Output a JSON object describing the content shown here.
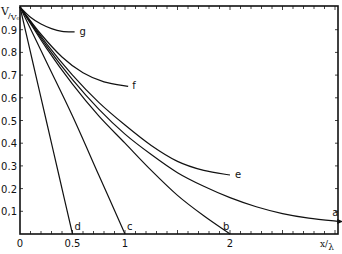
{
  "chart_data": {
    "type": "line",
    "title": "",
    "xlabel": "x/λ",
    "ylabel": "V/V₀",
    "xlim": [
      0,
      3.1
    ],
    "ylim": [
      0,
      1.0
    ],
    "grid": false,
    "legend": "inline curve labels",
    "x_ticks": [
      {
        "value": 0,
        "label": "0"
      },
      {
        "value": 0.5,
        "label": "0.5"
      },
      {
        "value": 1,
        "label": "1"
      },
      {
        "value": 2,
        "label": "2"
      }
    ],
    "y_ticks": [
      {
        "value": 0.1,
        "label": "0,1"
      },
      {
        "value": 0.2,
        "label": "0.2"
      },
      {
        "value": 0.3,
        "label": "0.3"
      },
      {
        "value": 0.4,
        "label": "0.4"
      },
      {
        "value": 0.5,
        "label": "0.5"
      },
      {
        "value": 0.6,
        "label": "0.6"
      },
      {
        "value": 0.7,
        "label": "0.7"
      },
      {
        "value": 0.8,
        "label": "0.8"
      },
      {
        "value": 0.9,
        "label": "0.9"
      }
    ],
    "series": [
      {
        "name": "a",
        "x": [
          0,
          0.25,
          0.5,
          0.75,
          1.0,
          1.25,
          1.5,
          1.75,
          2.0,
          2.25,
          2.5,
          2.75,
          3.05
        ],
        "y": [
          1.0,
          0.83,
          0.68,
          0.55,
          0.44,
          0.35,
          0.27,
          0.21,
          0.16,
          0.12,
          0.09,
          0.07,
          0.055
        ],
        "arrow_at_end": true
      },
      {
        "name": "b",
        "x": [
          0,
          0.25,
          0.5,
          0.75,
          1.0,
          1.25,
          1.5,
          1.75,
          2.0
        ],
        "y": [
          1.0,
          0.82,
          0.66,
          0.52,
          0.4,
          0.28,
          0.17,
          0.08,
          0.0
        ]
      },
      {
        "name": "c",
        "x": [
          0,
          0.25,
          0.5,
          0.75,
          1.0
        ],
        "y": [
          1.0,
          0.76,
          0.52,
          0.26,
          0.0
        ]
      },
      {
        "name": "d",
        "x": [
          0,
          0.125,
          0.25,
          0.375,
          0.5
        ],
        "y": [
          1.0,
          0.75,
          0.5,
          0.25,
          0.0
        ]
      },
      {
        "name": "e",
        "x": [
          0,
          0.25,
          0.5,
          0.75,
          1.0,
          1.25,
          1.5,
          1.75,
          2.0
        ],
        "y": [
          1.0,
          0.84,
          0.7,
          0.58,
          0.48,
          0.39,
          0.32,
          0.28,
          0.26
        ]
      },
      {
        "name": "f",
        "x": [
          0,
          0.2,
          0.4,
          0.6,
          0.8,
          1.03
        ],
        "y": [
          1.0,
          0.88,
          0.78,
          0.71,
          0.67,
          0.65
        ]
      },
      {
        "name": "g",
        "x": [
          0,
          0.1,
          0.2,
          0.3,
          0.4,
          0.52
        ],
        "y": [
          1.0,
          0.955,
          0.925,
          0.905,
          0.893,
          0.89
        ]
      }
    ]
  },
  "labels": {
    "y_axis_title_main": "V",
    "y_axis_title_sub": "V₀",
    "x_axis_title_main": "x",
    "x_axis_title_sub": "λ"
  },
  "style": {
    "line_color": "#111111",
    "background": "#ffffff"
  }
}
